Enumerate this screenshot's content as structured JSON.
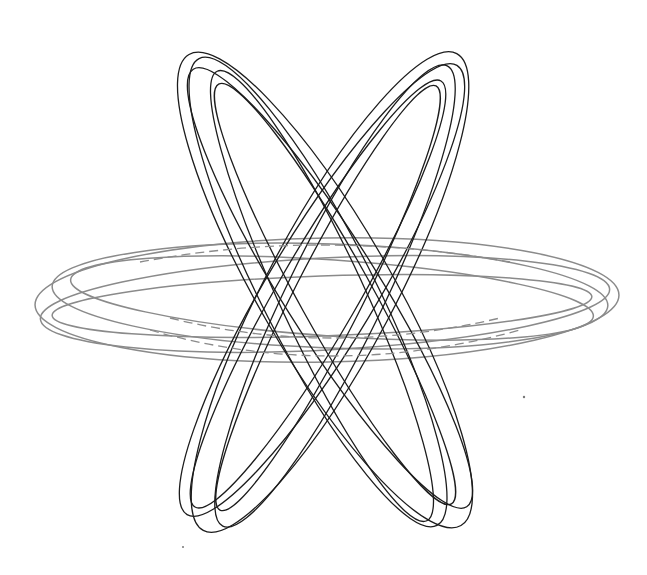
{
  "page": {
    "caption_clipped": "",
    "background": "#ffffff"
  },
  "figure": {
    "colors": {
      "diagonal_rings": "#1c1c1c",
      "horizontal_ring": "#8a8a8a"
    },
    "horizontal_ring": {
      "name": "horizontal-ring",
      "center": [
        327,
        300
      ],
      "rx": 292,
      "ry": 62,
      "strands": 5
    },
    "diagonal_ring_left": {
      "name": "ring-tilted-left",
      "center": [
        320,
        292
      ],
      "rx": 275,
      "ry": 62,
      "rotate_deg": 62,
      "strands": 5
    },
    "diagonal_ring_right": {
      "name": "ring-tilted-right",
      "center": [
        327,
        292
      ],
      "rx": 270,
      "ry": 60,
      "rotate_deg": -62,
      "strands": 5
    }
  }
}
